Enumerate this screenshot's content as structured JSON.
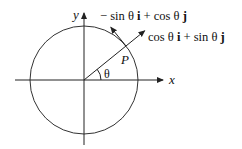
{
  "diagram": {
    "axes": {
      "x_label": "x",
      "y_label": "y"
    },
    "point_label": "P",
    "angle_label": "θ",
    "angle_degrees": 39,
    "vectors": [
      {
        "name": "tangential",
        "parts": [
          "− sin θ ",
          "i",
          " + cos θ ",
          "j"
        ]
      },
      {
        "name": "radial",
        "parts": [
          "cos θ ",
          "i",
          " + sin θ ",
          "j"
        ]
      }
    ],
    "colors": {
      "stroke": "#222222",
      "text": "#111111"
    }
  }
}
